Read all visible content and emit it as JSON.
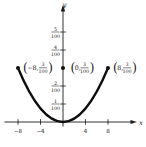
{
  "figure": {
    "x_axis_label": "x",
    "y_axis_label": "y",
    "x_ticks": [
      "−8",
      "−4",
      "4",
      "8"
    ],
    "y_ticks": [
      {
        "num": "1",
        "den": "100"
      },
      {
        "num": "2",
        "den": "100"
      },
      {
        "num": "4",
        "den": "100"
      },
      {
        "num": "5",
        "den": "100"
      }
    ],
    "points": [
      {
        "open": "(",
        "prefix": "−8,",
        "num": "3",
        "den": "100",
        "close": ")"
      },
      {
        "open": "(",
        "prefix": "0,",
        "num": "3",
        "den": "100",
        "close": ")"
      },
      {
        "open": "(",
        "prefix": "8,",
        "num": "3",
        "den": "100",
        "close": ")"
      }
    ]
  },
  "chart_data": {
    "type": "line",
    "title": "",
    "xlabel": "x",
    "ylabel": "y",
    "grid": false,
    "legend": false,
    "xlim": [
      -10,
      12.5
    ],
    "ylim": [
      0,
      0.058
    ],
    "x_ticks": [
      -8,
      -4,
      4,
      8
    ],
    "y_tick_values": [
      0.01,
      0.02,
      0.04,
      0.05
    ],
    "y_tick_labels": [
      "1/100",
      "2/100",
      "4/100",
      "5/100"
    ],
    "series": [
      {
        "name": "parabola",
        "equation": "y = (3/100)(x/8)^2",
        "x": [
          -8,
          -6,
          -4,
          -2,
          0,
          2,
          4,
          6,
          8
        ],
        "y": [
          0.03,
          0.016875,
          0.0075,
          0.001875,
          0,
          0.001875,
          0.0075,
          0.016875,
          0.03
        ]
      }
    ],
    "vertex": {
      "x": 0,
      "y": 0
    },
    "marked_points": [
      {
        "x": -8,
        "y": 0.03,
        "label": "(−8, 3/100)"
      },
      {
        "x": 0,
        "y": 0.03,
        "label": "(0, 3/100)"
      },
      {
        "x": 8,
        "y": 0.03,
        "label": "(8, 3/100)"
      }
    ]
  }
}
